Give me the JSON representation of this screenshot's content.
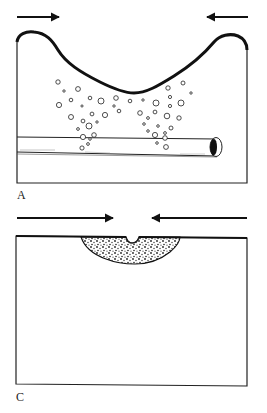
{
  "figure": {
    "panels": [
      {
        "label": "A",
        "description": "Deformed block surface with rod and scattered bubbles",
        "arrows": [
          {
            "direction": "right",
            "x1": 17,
            "x2": 58,
            "y": 17
          },
          {
            "direction": "left",
            "x1": 248,
            "x2": 208,
            "y": 17
          }
        ],
        "rod": {
          "x1": 17,
          "x2": 217,
          "top": 137,
          "bottom": 155
        }
      },
      {
        "label": "C",
        "description": "Flat block surface with stippled indentation zone",
        "arrows": [
          {
            "direction": "right",
            "x1": 17,
            "x2": 112,
            "y": 218
          },
          {
            "direction": "left",
            "x1": 247,
            "x2": 153,
            "y": 218
          }
        ]
      }
    ],
    "colors": {
      "ink": "#111111",
      "background": "#ffffff"
    }
  }
}
